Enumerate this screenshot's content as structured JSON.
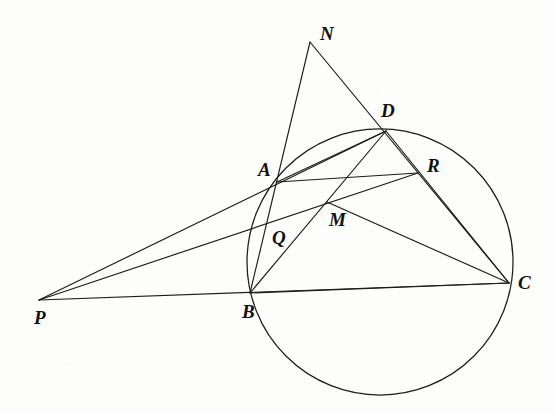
{
  "figure": {
    "kind": "euclidean-geometry-diagram",
    "background_color": "#fdfdfb",
    "stroke_color": "#1b1b1b",
    "width": 556,
    "height": 414
  },
  "points": [
    {
      "id": "P",
      "label": "P",
      "x": 39,
      "y": 300,
      "label_x": 34,
      "label_y": 308,
      "role": "external-point"
    },
    {
      "id": "N",
      "label": "N",
      "x": 310,
      "y": 42,
      "label_x": 320,
      "label_y": 24,
      "role": "apex-point"
    },
    {
      "id": "A",
      "label": "A",
      "x": 277,
      "y": 182,
      "label_x": 258,
      "label_y": 160,
      "role": "circle-point"
    },
    {
      "id": "B",
      "label": "B",
      "x": 250,
      "y": 293,
      "label_x": 242,
      "label_y": 302,
      "role": "circle-point"
    },
    {
      "id": "C",
      "label": "C",
      "x": 509,
      "y": 283,
      "label_x": 518,
      "label_y": 273,
      "role": "circle-point"
    },
    {
      "id": "D",
      "label": "D",
      "x": 386,
      "y": 131,
      "label_x": 381,
      "label_y": 101,
      "role": "circle-point"
    },
    {
      "id": "M",
      "label": "M",
      "x": 327,
      "y": 202,
      "label_x": 329,
      "label_y": 210,
      "role": "intersection-point"
    },
    {
      "id": "Q",
      "label": "Q",
      "x": 268,
      "y": 223,
      "label_x": 272,
      "label_y": 228,
      "role": "intersection-point"
    },
    {
      "id": "R",
      "label": "R",
      "x": 418,
      "y": 173,
      "label_x": 427,
      "label_y": 156,
      "role": "intersection-point"
    }
  ],
  "circle": {
    "id": "circumcircle-ABDC",
    "center_x": 380,
    "center_y": 262,
    "radius": 133,
    "through": [
      "A",
      "B",
      "D",
      "C"
    ]
  },
  "segments": [
    {
      "id": "P-D",
      "from": "P",
      "to": "D",
      "note": "secant through A"
    },
    {
      "id": "P-C",
      "from": "P",
      "to": "C",
      "note": "secant through B"
    },
    {
      "id": "P-R",
      "from": "P",
      "to": "R",
      "note": "line through Q and M"
    },
    {
      "id": "N-B",
      "from": "N",
      "to": "B",
      "note": "line through A"
    },
    {
      "id": "N-C",
      "from": "N",
      "to": "C",
      "note": "line through D"
    },
    {
      "id": "B-D",
      "from": "B",
      "to": "D",
      "note": "chord through M"
    },
    {
      "id": "A-R",
      "from": "A",
      "to": "R",
      "note": "segment through M"
    },
    {
      "id": "A-D",
      "from": "A",
      "to": "D",
      "note": "chord"
    },
    {
      "id": "D-C",
      "from": "D",
      "to": "C",
      "note": "chord"
    },
    {
      "id": "B-C",
      "from": "B",
      "to": "C",
      "note": "chord"
    },
    {
      "id": "M-C",
      "from": "M",
      "to": "C",
      "note": "segment"
    }
  ]
}
